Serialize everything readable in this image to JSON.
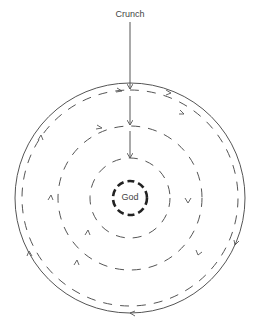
{
  "diagram": {
    "top_label": "Crunch",
    "center_label": "God",
    "colors": {
      "line": "#555555",
      "center_ring": "#222222"
    },
    "rings": [
      {
        "name": "outer",
        "radius": 115,
        "style": "solid",
        "direction": "clockwise"
      },
      {
        "name": "ring-2",
        "radius": 108,
        "style": "dashed"
      },
      {
        "name": "ring-3",
        "radius": 72,
        "style": "dashed"
      },
      {
        "name": "ring-4",
        "radius": 40,
        "style": "dashed"
      },
      {
        "name": "center",
        "radius": 17,
        "style": "thick-dashed"
      }
    ]
  }
}
